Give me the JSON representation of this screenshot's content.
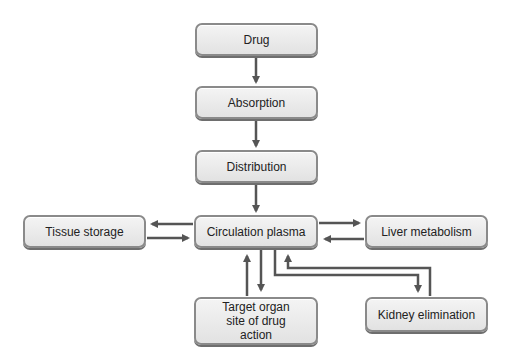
{
  "diagram": {
    "title": "",
    "nodes": {
      "drug": {
        "label": "Drug"
      },
      "absorption": {
        "label": "Absorption"
      },
      "distribution": {
        "label": "Distribution"
      },
      "circulation": {
        "label": "Circulation plasma"
      },
      "tissue": {
        "label": "Tissue storage"
      },
      "liver": {
        "label": "Liver metabolism"
      },
      "target": {
        "label": "Target organ site of drug action"
      },
      "kidney": {
        "label": "Kidney elimination"
      }
    },
    "edges": [
      {
        "from": "Drug",
        "to": "Absorption"
      },
      {
        "from": "Absorption",
        "to": "Distribution"
      },
      {
        "from": "Distribution",
        "to": "Circulation plasma"
      },
      {
        "from": "Circulation plasma",
        "to": "Tissue storage"
      },
      {
        "from": "Tissue storage",
        "to": "Circulation plasma"
      },
      {
        "from": "Circulation plasma",
        "to": "Liver metabolism"
      },
      {
        "from": "Liver metabolism",
        "to": "Circulation plasma"
      },
      {
        "from": "Circulation plasma",
        "to": "Target organ site of drug action"
      },
      {
        "from": "Target organ site of drug action",
        "to": "Circulation plasma"
      },
      {
        "from": "Circulation plasma",
        "to": "Kidney elimination"
      },
      {
        "from": "Kidney elimination",
        "to": "Circulation plasma"
      }
    ],
    "colors": {
      "arrow": "#555555",
      "box_border": "#8a8a8a",
      "box_fill": "#e8e8e8"
    }
  }
}
